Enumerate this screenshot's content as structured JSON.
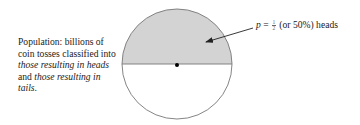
{
  "caption": {
    "part1": "Population: billions of coin tosses classified into ",
    "italic1": "those resulting in heads",
    "part2": " and ",
    "italic2": "those resulting in tails",
    "part3": "."
  },
  "label": {
    "variable": "p",
    "equals": " =",
    "fraction_numerator": "1",
    "fraction_denominator": "2",
    "rest": "(or 50%) heads"
  },
  "colors": {
    "heads_fill": "#d3d3d3",
    "tails_fill": "#ffffff",
    "outline": "#777777",
    "arrow": "#222222",
    "center_dot": "#000000"
  },
  "geometry": {
    "circle_center": [
      177,
      64
    ],
    "circle_radius": 55
  }
}
